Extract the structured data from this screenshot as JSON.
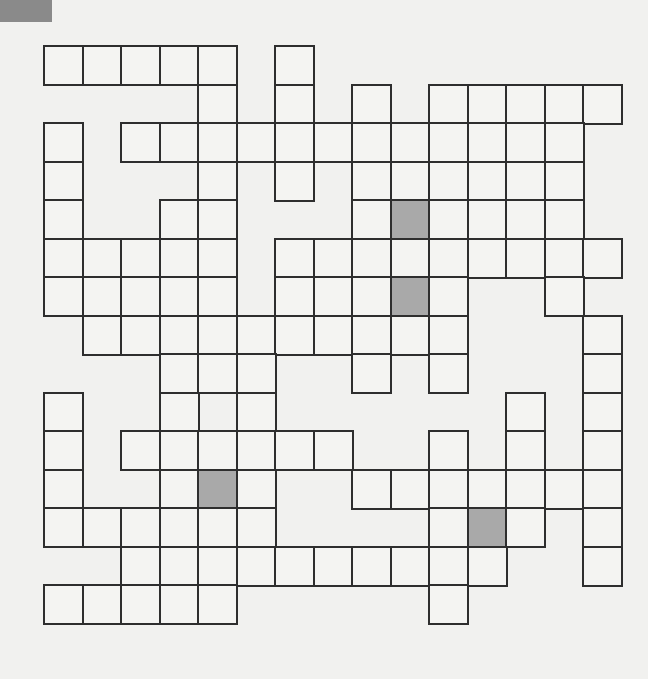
{
  "puzzle": {
    "type": "crossword-grid",
    "corner_color": "#8a8a8a",
    "cell_size": 38.5,
    "origin": {
      "x": 44,
      "y": 46
    },
    "rows": [
      {
        "cells": [
          0,
          1,
          2,
          3,
          4,
          6
        ],
        "shaded": []
      },
      {
        "cells": [
          4,
          6,
          8,
          10,
          11,
          12,
          13,
          14
        ],
        "shaded": []
      },
      {
        "cells": [
          0,
          2,
          3,
          4,
          5,
          6,
          7,
          8,
          9,
          10,
          11,
          12,
          13
        ],
        "shaded": []
      },
      {
        "cells": [
          0,
          4,
          6,
          8,
          9,
          10,
          11,
          12,
          13
        ],
        "shaded": []
      },
      {
        "cells": [
          0,
          3,
          4,
          8,
          9,
          10,
          11,
          12,
          13
        ],
        "shaded": [
          9
        ]
      },
      {
        "cells": [
          0,
          1,
          2,
          3,
          4,
          6,
          7,
          8,
          9,
          10,
          11,
          12,
          13,
          14
        ],
        "shaded": []
      },
      {
        "cells": [
          0,
          1,
          2,
          3,
          4,
          6,
          7,
          8,
          9,
          10,
          13
        ],
        "shaded": [
          9
        ]
      },
      {
        "cells": [
          1,
          2,
          3,
          4,
          5,
          6,
          7,
          8,
          9,
          10,
          14
        ],
        "shaded": []
      },
      {
        "cells": [
          3,
          4,
          5,
          8,
          10,
          14
        ],
        "shaded": []
      },
      {
        "cells": [
          0,
          3,
          5,
          12,
          14
        ],
        "shaded": []
      },
      {
        "cells": [
          0,
          2,
          3,
          4,
          5,
          6,
          7,
          10,
          12,
          14
        ],
        "shaded": []
      },
      {
        "cells": [
          0,
          3,
          4,
          5,
          8,
          9,
          10,
          11,
          12,
          13,
          14
        ],
        "shaded": [
          4
        ]
      },
      {
        "cells": [
          0,
          1,
          2,
          3,
          4,
          5,
          10,
          11,
          12,
          14
        ],
        "shaded": [
          11
        ]
      },
      {
        "cells": [
          2,
          3,
          4,
          5,
          6,
          7,
          8,
          9,
          10,
          11,
          14
        ],
        "shaded": []
      },
      {
        "cells": [
          0,
          1,
          2,
          3,
          4,
          10
        ],
        "shaded": []
      }
    ]
  }
}
